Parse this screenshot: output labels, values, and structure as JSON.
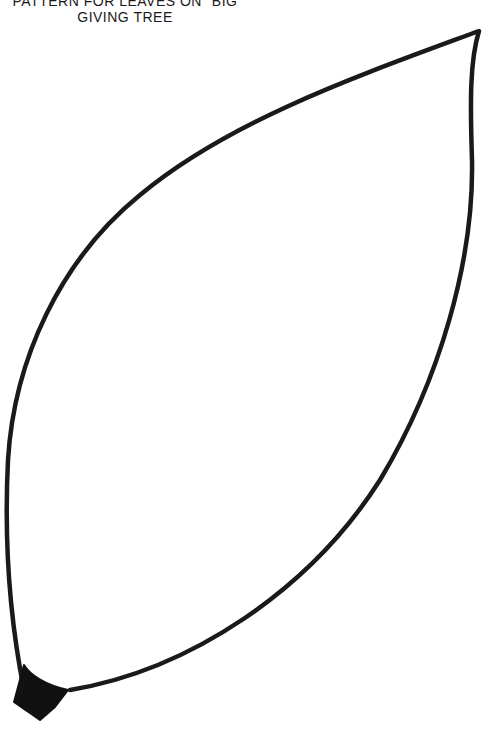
{
  "title": {
    "line1": "PATTERN FOR LEAVES ON \"BIG",
    "line2": "GIVING TREE"
  },
  "leaf": {
    "stroke_color": "#1a1a1a",
    "fill_color": "#ffffff",
    "stem_color": "#111111",
    "icon": "leaf-outline-icon"
  }
}
